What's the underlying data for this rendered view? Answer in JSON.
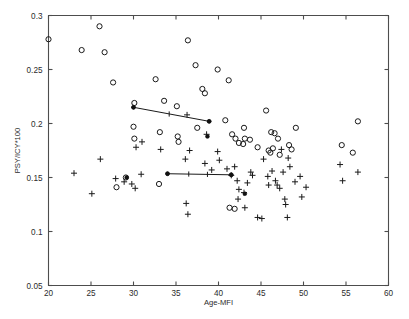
{
  "chart_data": {
    "type": "scatter",
    "title": "",
    "xlabel": "Age-MFI",
    "ylabel": "PSY/ICY*100",
    "xlim": [
      20,
      60
    ],
    "ylim": [
      0.05,
      0.3
    ],
    "xticks": [
      20,
      25,
      30,
      35,
      40,
      45,
      50,
      55,
      60
    ],
    "xticklabels": [
      "20",
      "25",
      "30",
      "35",
      "40",
      "45",
      "50",
      "55",
      "60"
    ],
    "yticks": [
      0.05,
      0.1,
      0.15,
      0.2,
      0.25,
      0.3
    ],
    "yticklabels": [
      "0.05",
      "0.1",
      "0.15",
      "0.2",
      "0.25",
      "0.3"
    ],
    "grid": false,
    "legend": false,
    "legend_position": "none",
    "series": [
      {
        "name": "open-circle-group",
        "marker": "o",
        "color": "#1a1a1a",
        "points": [
          [
            20.0,
            0.278
          ],
          [
            23.9,
            0.268
          ],
          [
            26.0,
            0.29
          ],
          [
            26.6,
            0.266
          ],
          [
            27.6,
            0.238
          ],
          [
            30.1,
            0.219
          ],
          [
            32.6,
            0.241
          ],
          [
            33.6,
            0.221
          ],
          [
            35.1,
            0.216
          ],
          [
            36.4,
            0.277
          ],
          [
            37.3,
            0.254
          ],
          [
            38.1,
            0.232
          ],
          [
            38.4,
            0.228
          ],
          [
            39.9,
            0.25
          ],
          [
            30.0,
            0.197
          ],
          [
            30.1,
            0.186
          ],
          [
            33.1,
            0.192
          ],
          [
            35.2,
            0.188
          ],
          [
            35.3,
            0.183
          ],
          [
            37.5,
            0.196
          ],
          [
            40.8,
            0.203
          ],
          [
            41.2,
            0.24
          ],
          [
            41.6,
            0.19
          ],
          [
            42.0,
            0.186
          ],
          [
            42.4,
            0.182
          ],
          [
            42.9,
            0.181
          ],
          [
            43.1,
            0.186
          ],
          [
            43.0,
            0.196
          ],
          [
            43.7,
            0.185
          ],
          [
            44.6,
            0.178
          ],
          [
            45.6,
            0.212
          ],
          [
            45.9,
            0.175
          ],
          [
            46.1,
            0.173
          ],
          [
            46.4,
            0.177
          ],
          [
            46.2,
            0.192
          ],
          [
            46.6,
            0.191
          ],
          [
            47.0,
            0.186
          ],
          [
            47.2,
            0.171
          ],
          [
            48.3,
            0.18
          ],
          [
            48.6,
            0.176
          ],
          [
            49.1,
            0.196
          ],
          [
            54.5,
            0.18
          ],
          [
            56.4,
            0.202
          ],
          [
            55.8,
            0.173
          ],
          [
            28.0,
            0.141
          ],
          [
            29.1,
            0.15
          ],
          [
            33.0,
            0.144
          ],
          [
            41.3,
            0.122
          ],
          [
            41.9,
            0.121
          ]
        ]
      },
      {
        "name": "plus-group",
        "marker": "+",
        "color": "#1a1a1a",
        "points": [
          [
            23.0,
            0.154
          ],
          [
            25.1,
            0.135
          ],
          [
            26.1,
            0.167
          ],
          [
            27.9,
            0.149
          ],
          [
            28.9,
            0.146
          ],
          [
            29.8,
            0.144
          ],
          [
            30.2,
            0.14
          ],
          [
            30.9,
            0.153
          ],
          [
            30.3,
            0.178
          ],
          [
            31.0,
            0.183
          ],
          [
            33.2,
            0.176
          ],
          [
            36.3,
            0.208
          ],
          [
            36.1,
            0.167
          ],
          [
            36.6,
            0.175
          ],
          [
            36.2,
            0.126
          ],
          [
            36.4,
            0.116
          ],
          [
            38.6,
            0.19
          ],
          [
            38.4,
            0.163
          ],
          [
            39.2,
            0.157
          ],
          [
            39.9,
            0.174
          ],
          [
            40.1,
            0.166
          ],
          [
            41.0,
            0.158
          ],
          [
            41.5,
            0.152
          ],
          [
            41.9,
            0.16
          ],
          [
            42.2,
            0.147
          ],
          [
            42.4,
            0.139
          ],
          [
            42.3,
            0.13
          ],
          [
            43.0,
            0.136
          ],
          [
            43.1,
            0.122
          ],
          [
            43.4,
            0.145
          ],
          [
            43.8,
            0.155
          ],
          [
            44.0,
            0.152
          ],
          [
            44.6,
            0.113
          ],
          [
            45.1,
            0.112
          ],
          [
            45.3,
            0.167
          ],
          [
            45.8,
            0.151
          ],
          [
            45.9,
            0.143
          ],
          [
            46.3,
            0.156
          ],
          [
            46.7,
            0.147
          ],
          [
            46.9,
            0.143
          ],
          [
            47.2,
            0.14
          ],
          [
            47.4,
            0.176
          ],
          [
            47.6,
            0.155
          ],
          [
            47.8,
            0.13
          ],
          [
            47.9,
            0.125
          ],
          [
            48.2,
            0.168
          ],
          [
            48.4,
            0.16
          ],
          [
            48.1,
            0.113
          ],
          [
            49.0,
            0.146
          ],
          [
            49.6,
            0.151
          ],
          [
            49.8,
            0.132
          ],
          [
            50.3,
            0.141
          ],
          [
            54.3,
            0.162
          ],
          [
            54.6,
            0.147
          ],
          [
            56.4,
            0.155
          ]
        ]
      },
      {
        "name": "filled-group",
        "marker": ".",
        "color": "#111111",
        "points": [
          [
            30.0,
            0.215
          ],
          [
            38.9,
            0.202
          ],
          [
            34.0,
            0.1535
          ],
          [
            41.5,
            0.1525
          ],
          [
            38.7,
            0.188
          ],
          [
            29.2,
            0.15
          ],
          [
            43.1,
            0.135
          ]
        ]
      }
    ],
    "trend_lines": [
      {
        "name": "upper-trend-line",
        "points": [
          [
            30.0,
            0.215
          ],
          [
            38.9,
            0.202
          ]
        ],
        "ticks": [
          [
            34.2,
            0.2088
          ]
        ]
      },
      {
        "name": "lower-trend-line",
        "points": [
          [
            34.0,
            0.1535
          ],
          [
            41.5,
            0.1525
          ]
        ],
        "ticks": [
          [
            36.5,
            0.1532
          ],
          [
            38.7,
            0.1529
          ]
        ]
      }
    ]
  }
}
